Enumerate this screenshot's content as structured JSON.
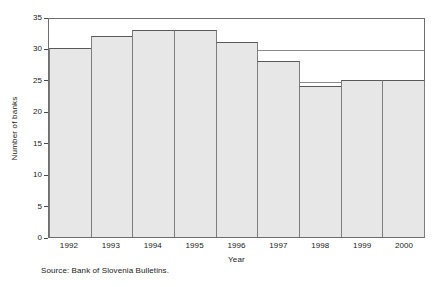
{
  "chart_data": {
    "type": "bar",
    "title": "",
    "subtitle": "",
    "xlabel": "Year",
    "ylabel": "Number of banks",
    "categories": [
      "1992",
      "1993",
      "1994",
      "1995",
      "1996",
      "1997",
      "1998",
      "1999",
      "2000"
    ],
    "values": [
      30,
      32,
      33,
      33,
      31,
      28,
      24,
      25,
      25
    ],
    "series": [
      {
        "name": "Number of banks",
        "values": [
          30,
          32,
          33,
          33,
          31,
          28,
          24,
          25,
          25
        ]
      }
    ],
    "ylim": [
      0,
      35
    ],
    "yticks": [
      0,
      5,
      10,
      15,
      20,
      25,
      30,
      35
    ],
    "ytick_labels": [
      "0",
      "5",
      "10",
      "15",
      "20",
      "25",
      "30",
      "35"
    ],
    "grid": true,
    "gridlines_y": [
      25,
      30
    ],
    "legend": null,
    "legend_position": "none",
    "bar_fill_color": "#e7e7e7",
    "bar_edge_color": "#595959",
    "frame_color": "#6e6e6e",
    "background_color": "#ffffff",
    "annotations": []
  },
  "figure": {
    "source_note": "Source: Bank of Slovenia Bulletins."
  }
}
